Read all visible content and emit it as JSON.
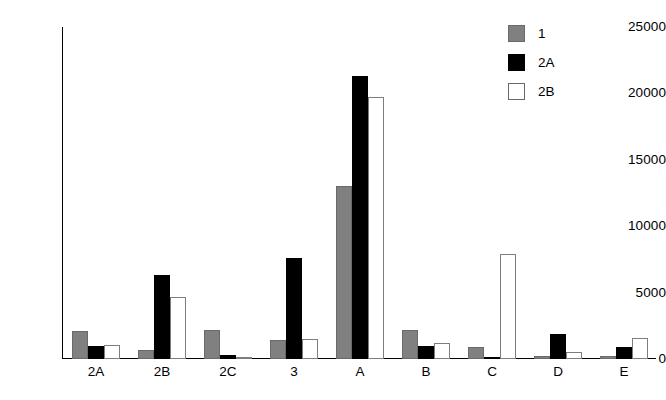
{
  "chart_data": {
    "type": "bar",
    "title": "",
    "xlabel": "",
    "ylabel": "",
    "categories": [
      "2A",
      "2B",
      "2C",
      "3",
      "A",
      "B",
      "C",
      "D",
      "E"
    ],
    "series": [
      {
        "name": "1",
        "color": "#808080",
        "values": [
          2100,
          700,
          2200,
          1400,
          13000,
          2200,
          900,
          200,
          200
        ]
      },
      {
        "name": "2A",
        "color": "#000000",
        "values": [
          1000,
          6300,
          300,
          7600,
          21300,
          1000,
          150,
          1900,
          900
        ]
      },
      {
        "name": "2B",
        "color": "#ffffff",
        "values": [
          1050,
          4700,
          40,
          1500,
          19700,
          1200,
          7900,
          500,
          1600
        ]
      }
    ],
    "ylim": [
      0,
      25000
    ],
    "yticks": [
      0,
      5000,
      10000,
      15000,
      20000,
      25000
    ],
    "ytick_labels": [
      "0",
      "5000",
      "10000",
      "15000",
      "20000",
      "25000"
    ],
    "grid": false,
    "legend_position": "top-right",
    "legend_entries": [
      "1",
      "2A",
      "2B"
    ]
  }
}
